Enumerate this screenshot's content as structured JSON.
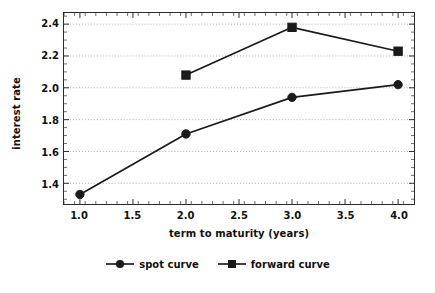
{
  "chart_data": {
    "type": "line",
    "title": "",
    "xlabel": "term to maturity (years)",
    "ylabel": "interest rate",
    "x": [
      1.0,
      2.0,
      3.0,
      4.0
    ],
    "xlim": [
      0.85,
      4.15
    ],
    "ylim": [
      1.27,
      2.47
    ],
    "xticks": [
      "1.0",
      "1.5",
      "2.0",
      "2.5",
      "3.0",
      "3.5",
      "4.0"
    ],
    "xtick_values": [
      1.0,
      1.5,
      2.0,
      2.5,
      3.0,
      3.5,
      4.0
    ],
    "yticks": [
      "1.4",
      "1.6",
      "1.8",
      "2.0",
      "2.2",
      "2.4"
    ],
    "ytick_values": [
      1.4,
      1.6,
      1.8,
      2.0,
      2.2,
      2.4
    ],
    "grid": "horizontal-dotted",
    "legend_position": "below-center",
    "series": [
      {
        "name": "spot curve",
        "marker": "circle",
        "color": "#1a1a1a",
        "x": [
          1.0,
          2.0,
          3.0,
          4.0
        ],
        "values": [
          1.33,
          1.71,
          1.94,
          2.02
        ]
      },
      {
        "name": "forward curve",
        "marker": "square",
        "color": "#1a1a1a",
        "x": [
          2.0,
          3.0,
          4.0
        ],
        "values": [
          2.08,
          2.38,
          2.23
        ]
      }
    ]
  },
  "legend": {
    "items": [
      {
        "label": "spot curve"
      },
      {
        "label": "forward curve"
      }
    ]
  },
  "axes": {
    "x_title": "term to maturity (years)",
    "y_title": "interest rate"
  }
}
